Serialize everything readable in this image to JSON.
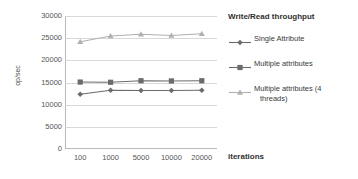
{
  "chart_data": {
    "type": "line",
    "title": "Write/Read throughput",
    "xlabel": "iterations",
    "ylabel": "op/sec",
    "categories": [
      "100",
      "1000",
      "5000",
      "10000",
      "20000"
    ],
    "ylim": [
      0,
      30000
    ],
    "yticks": [
      "0",
      "5000",
      "10000",
      "15000",
      "20000",
      "25000",
      "30000"
    ],
    "grid": true,
    "legend_position": "right",
    "series": [
      {
        "name": "Single Attribute",
        "marker": "diamond",
        "color": "#6b6b6b",
        "values": [
          12350,
          13250,
          13200,
          13200,
          13250
        ]
      },
      {
        "name": "Multiple attributes",
        "marker": "square",
        "color": "#6b6b6b",
        "values": [
          15100,
          15050,
          15400,
          15350,
          15400
        ]
      },
      {
        "name": "Multiple attributes (4 threads)",
        "name_line1": "Multiple attributes (4",
        "name_line2": "threads)",
        "marker": "triangle",
        "color": "#b0b0b0",
        "values": [
          24200,
          25500,
          25900,
          25600,
          26000
        ]
      }
    ]
  },
  "legend": {
    "title": "Write/Read throughput",
    "items": [
      {
        "label": "Single Attribute"
      },
      {
        "label": "Multiple attributes"
      },
      {
        "label_line1": "Multiple attributes (4",
        "label_line2": "threads)"
      }
    ]
  },
  "axes": {
    "y_title": "op/sec",
    "x_title": "iterations"
  },
  "colors": {
    "series_dark": "#6b6b6b",
    "series_light": "#b0b0b0",
    "gridline": "#d8d8d8",
    "axis": "#b9b9b9",
    "text": "#3a3a3a"
  }
}
